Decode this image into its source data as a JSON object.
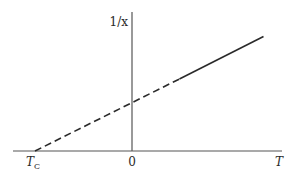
{
  "chart_data": {
    "type": "line",
    "title": "",
    "xlabel": "T",
    "ylabel": "1/x",
    "grid": false,
    "legend": "none",
    "xlim": [
      -4.5,
      6.5
    ],
    "ylim": [
      0,
      5.6
    ],
    "x_ticks": [
      {
        "value": -4.5,
        "label": "T",
        "subscript": "C"
      },
      {
        "value": 0,
        "label": "0"
      }
    ],
    "series": [
      {
        "name": "extrapolation",
        "style": "dashed",
        "points": [
          [
            -4.5,
            0
          ],
          [
            2.2,
            3.3
          ]
        ]
      },
      {
        "name": "measured",
        "style": "solid",
        "points": [
          [
            2.2,
            3.3
          ],
          [
            6.1,
            5.25
          ]
        ]
      }
    ],
    "y_intercept": 2.2,
    "x_intercept_label": "T_C",
    "colors": {
      "line": "#2a2a2a",
      "axis": "#555555"
    }
  }
}
